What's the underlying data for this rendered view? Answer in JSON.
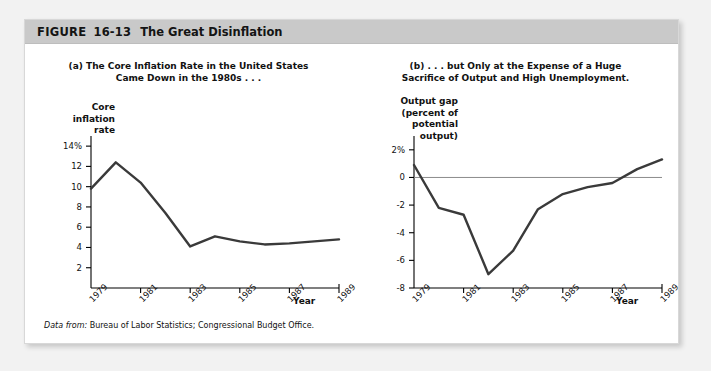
{
  "header": {
    "figure_word": "FIGURE",
    "figure_number": "16-13",
    "title": "The Great Disinflation"
  },
  "source_note": {
    "lead": "Data from:",
    "text": "Bureau of Labor Statistics; Congressional Budget Office."
  },
  "colors": {
    "header_band": "#c9c9c9",
    "card": "#ffffff",
    "page": "#f2f2f2",
    "data_line": "#3a3a3a",
    "axis": "#000000",
    "zero_line": "#8c8c8c"
  },
  "panel_a": {
    "title_line1": "(a) The Core Inflation Rate in the United States",
    "title_line2": "Came Down in the 1980s . . .",
    "axis_title_line1": "Core",
    "axis_title_line2": "inflation",
    "axis_title_line3": "rate",
    "x_axis_label": "Year"
  },
  "panel_b": {
    "title_line1": "(b) . . . but Only at the Expense of a Huge",
    "title_line2": "Sacrifice of Output and High Unemployment.",
    "axis_title_line1": "Output gap",
    "axis_title_line2": "(percent of",
    "axis_title_line3": "potential",
    "axis_title_line4": "output)",
    "x_axis_label": "Year"
  },
  "chart_data": [
    {
      "type": "line",
      "panel": "a",
      "title": "(a) The Core Inflation Rate in the United States Came Down in the 1980s . . .",
      "xlabel": "Year",
      "ylabel": "Core inflation rate",
      "x": [
        1979,
        1980,
        1981,
        1982,
        1983,
        1984,
        1985,
        1986,
        1987,
        1988,
        1989
      ],
      "values": [
        9.8,
        12.4,
        10.4,
        7.4,
        4.1,
        5.1,
        4.6,
        4.3,
        4.4,
        4.6,
        4.8
      ],
      "ytick_labels": [
        "14%",
        "12",
        "10",
        "8",
        "6",
        "4",
        "2"
      ],
      "yticks": [
        14,
        12,
        10,
        8,
        6,
        4,
        2
      ],
      "ylim": [
        0,
        15
      ],
      "xtick_labels": [
        "1979",
        "1981",
        "1983",
        "1985",
        "1987",
        "1989"
      ],
      "xticks": [
        1979,
        1981,
        1983,
        1985,
        1987,
        1989
      ],
      "xlim": [
        1979,
        1989
      ],
      "grid": false,
      "legend": "none"
    },
    {
      "type": "line",
      "panel": "b",
      "title": "(b) . . . but Only at the Expense of a Huge Sacrifice of Output and High Unemployment.",
      "xlabel": "Year",
      "ylabel": "Output gap (percent of potential output)",
      "x": [
        1979,
        1980,
        1981,
        1982,
        1983,
        1984,
        1985,
        1986,
        1987,
        1988,
        1989
      ],
      "values": [
        0.9,
        -2.2,
        -2.7,
        -7.0,
        -5.3,
        -2.3,
        -1.2,
        -0.7,
        -0.4,
        0.6,
        1.3
      ],
      "ytick_labels": [
        "2%",
        "0",
        "-2",
        "-4",
        "-6",
        "-8"
      ],
      "yticks": [
        2,
        0,
        -2,
        -4,
        -6,
        -8
      ],
      "ylim": [
        -8,
        3
      ],
      "xtick_labels": [
        "1979",
        "1981",
        "1983",
        "1985",
        "1987",
        "1989"
      ],
      "xticks": [
        1979,
        1981,
        1983,
        1985,
        1987,
        1989
      ],
      "xlim": [
        1979,
        1989
      ],
      "zero_reference_line": 0,
      "grid": false,
      "legend": "none"
    }
  ]
}
